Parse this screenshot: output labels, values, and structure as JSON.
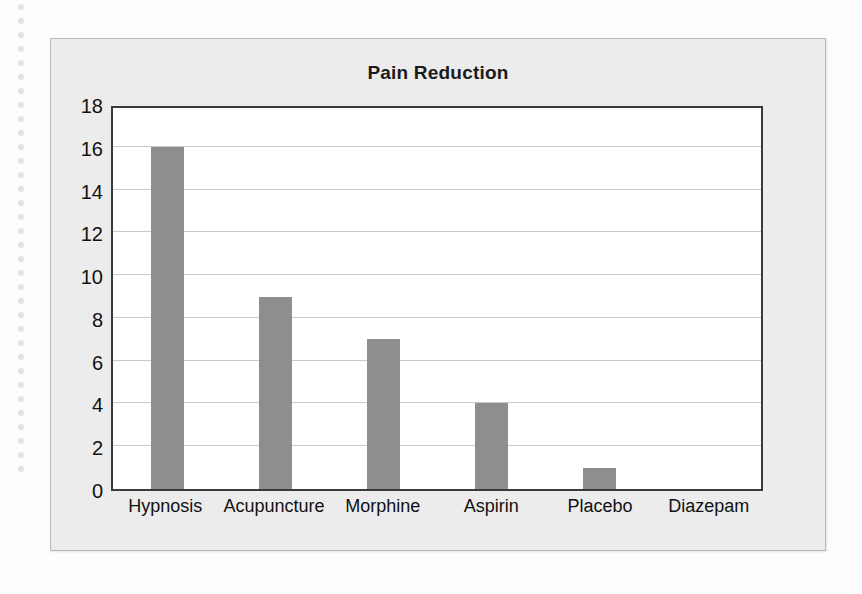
{
  "chart_data": {
    "type": "bar",
    "title": "Pain Reduction",
    "xlabel": "",
    "ylabel": "",
    "categories": [
      "Hypnosis",
      "Acupuncture",
      "Morphine",
      "Aspirin",
      "Placebo",
      "Diazepam"
    ],
    "values": [
      16,
      9,
      7,
      4,
      1,
      0
    ],
    "ylim": [
      0,
      18
    ],
    "ytick_step": 2,
    "yticks": [
      18,
      16,
      14,
      12,
      10,
      8,
      6,
      4,
      2,
      0
    ],
    "grid": true,
    "legend": null,
    "bar_color": "#8e8e8e",
    "panel_color": "#ececec",
    "plot_background": "#ffffff",
    "gridline_color": "#c9c9c9",
    "axis_color": "#3a3a3a",
    "text_color": "#111111"
  },
  "decor": {
    "dot_color": "#e3e3e3",
    "dot_count": 34
  }
}
